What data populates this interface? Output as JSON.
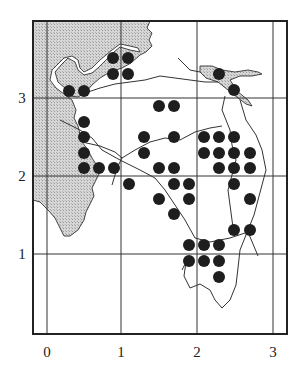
{
  "figure": {
    "type": "grid-map",
    "x_axis": {
      "ticks": [
        "0",
        "1",
        "2",
        "3"
      ]
    },
    "y_axis": {
      "ticks": [
        "1",
        "2",
        "3"
      ]
    },
    "colors": {
      "sea": "#c8c8c8",
      "land": "#ffffff",
      "dot": "#1e1e1e",
      "line": "#333333"
    }
  },
  "dots": [
    [
      69,
      91
    ],
    [
      84,
      91
    ],
    [
      113,
      58
    ],
    [
      128,
      58
    ],
    [
      113,
      74
    ],
    [
      128,
      74
    ],
    [
      219,
      74
    ],
    [
      234,
      90
    ],
    [
      84,
      122
    ],
    [
      84,
      137
    ],
    [
      84,
      153
    ],
    [
      84,
      168
    ],
    [
      99,
      168
    ],
    [
      114,
      168
    ],
    [
      159,
      106
    ],
    [
      174,
      106
    ],
    [
      144,
      137
    ],
    [
      144,
      153
    ],
    [
      174,
      137
    ],
    [
      129,
      184
    ],
    [
      159,
      168
    ],
    [
      174,
      168
    ],
    [
      174,
      184
    ],
    [
      189,
      184
    ],
    [
      159,
      199
    ],
    [
      189,
      199
    ],
    [
      174,
      214
    ],
    [
      204,
      137
    ],
    [
      219,
      137
    ],
    [
      234,
      137
    ],
    [
      204,
      153
    ],
    [
      219,
      153
    ],
    [
      234,
      153
    ],
    [
      250,
      153
    ],
    [
      219,
      168
    ],
    [
      234,
      168
    ],
    [
      250,
      168
    ],
    [
      234,
      184
    ],
    [
      250,
      199
    ],
    [
      234,
      230
    ],
    [
      250,
      230
    ],
    [
      189,
      245
    ],
    [
      204,
      245
    ],
    [
      219,
      245
    ],
    [
      189,
      261
    ],
    [
      204,
      261
    ],
    [
      219,
      261
    ],
    [
      219,
      277
    ]
  ]
}
